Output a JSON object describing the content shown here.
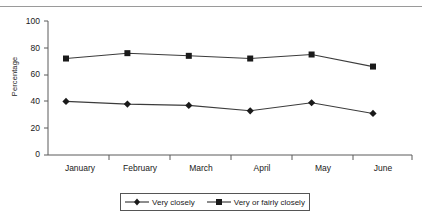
{
  "chart_data": {
    "type": "line",
    "title": "",
    "xlabel": "",
    "ylabel": "Percentage",
    "categories": [
      "January",
      "February",
      "March",
      "April",
      "May",
      "June"
    ],
    "ylim": [
      0,
      100
    ],
    "yticks": [
      0,
      20,
      40,
      60,
      80,
      100
    ],
    "grid": false,
    "legend_position": "bottom",
    "series": [
      {
        "name": "Very closely",
        "marker": "diamond",
        "color": "#1a1a1a",
        "values": [
          40,
          38,
          37,
          33,
          39,
          31
        ]
      },
      {
        "name": "Very or fairly closely",
        "marker": "square",
        "color": "#1a1a1a",
        "values": [
          72,
          76,
          74,
          72,
          75,
          66
        ]
      }
    ]
  },
  "axis": {
    "y_title": "Percentage",
    "y_tick_labels": [
      "100",
      "80",
      "60",
      "40",
      "20",
      "0"
    ],
    "x_tick_labels": [
      "January",
      "February",
      "March",
      "April",
      "May",
      "June"
    ]
  },
  "legend": {
    "entries": [
      {
        "label": "Very closely",
        "marker": "diamond"
      },
      {
        "label": "Very or fairly closely",
        "marker": "square"
      }
    ]
  }
}
